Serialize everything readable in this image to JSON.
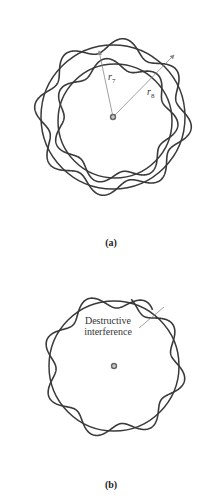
{
  "figure_a": {
    "caption": "(a)",
    "radius_inner_label": "r",
    "radius_inner_sub": "7",
    "radius_outer_label": "r",
    "radius_outer_sub": "8",
    "nucleus_symbol": "⊕"
  },
  "figure_b": {
    "caption": "(b)",
    "annotation_line1": "Destructive",
    "annotation_line2": "interference",
    "nucleus_symbol": "⊕"
  },
  "colors": {
    "stroke": "#3a3a3a",
    "arrow": "#888888"
  }
}
